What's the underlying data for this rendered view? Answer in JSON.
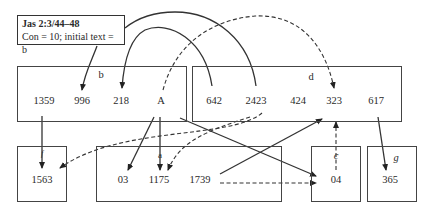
{
  "header": {
    "reference": "Jas 2:3/44–48",
    "subtitle": "Con = 10; initial text = b"
  },
  "boxes": {
    "b": {
      "label": "b",
      "values": [
        "1359",
        "996",
        "218",
        "A"
      ]
    },
    "d": {
      "label": "d",
      "values": [
        "642",
        "2423",
        "424",
        "323",
        "617"
      ]
    },
    "f": {
      "label": "f",
      "values": [
        "1563"
      ]
    },
    "a": {
      "label": "a",
      "values": [
        "03",
        "1175",
        "1739"
      ]
    },
    "c": {
      "label": "c",
      "values": [
        "04"
      ]
    },
    "g": {
      "label": "g",
      "values": [
        "365"
      ]
    }
  },
  "edges": [
    {
      "from": "header",
      "to": "996",
      "style": "solid"
    },
    {
      "from": "642",
      "to": "218",
      "style": "solid"
    },
    {
      "from": "2423",
      "to": "header",
      "style": "solid"
    },
    {
      "from": "A",
      "to": "323",
      "style": "dashed"
    },
    {
      "from": "1359",
      "to": "1563",
      "style": "solid"
    },
    {
      "from": "424",
      "to": "1563",
      "style": "dashed"
    },
    {
      "from": "A",
      "to": "03",
      "style": "solid"
    },
    {
      "from": "A",
      "to": "1175",
      "style": "solid"
    },
    {
      "from": "424",
      "to": "1175",
      "style": "dashed"
    },
    {
      "from": "A",
      "to": "04",
      "style": "solid"
    },
    {
      "from": "1739",
      "to": "323",
      "style": "solid"
    },
    {
      "from": "1739",
      "to": "04",
      "style": "dashed"
    },
    {
      "from": "04",
      "to": "323",
      "style": "dashed"
    },
    {
      "from": "617",
      "to": "365",
      "style": "solid"
    }
  ]
}
